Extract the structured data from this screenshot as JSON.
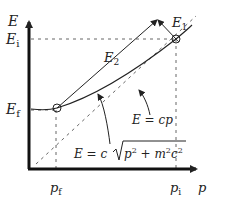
{
  "diagram": {
    "axes": {
      "y_label": "E",
      "x_label": "p"
    },
    "y_ticks": [
      {
        "main": "E",
        "sub": "i"
      },
      {
        "main": "E",
        "sub": "f"
      }
    ],
    "x_ticks": [
      {
        "main": "p",
        "sub": "f"
      },
      {
        "main": "p",
        "sub": "i"
      }
    ],
    "vectors": [
      {
        "main": "E",
        "sub": "1"
      },
      {
        "main": "E",
        "sub": "2"
      }
    ],
    "annotations": {
      "asymptote": "E = cp",
      "curve": "E = c√(p² + m²c²)",
      "curve_parts": {
        "lhs": "E = c",
        "p": "p",
        "p_exp": "2",
        "plus": " + m",
        "m_exp": "2",
        "c": "c",
        "c_exp": "2"
      }
    },
    "colors": {
      "ink": "#222222",
      "dashed": "#555555"
    }
  }
}
